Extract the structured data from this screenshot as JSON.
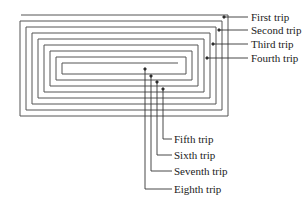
{
  "diagram": {
    "type": "rectangular-spiral",
    "colors": {
      "line": "#555555",
      "text": "#222222",
      "background": "#ffffff"
    },
    "trip_labels": [
      {
        "label": "First trip",
        "side": "right"
      },
      {
        "label": "Second trip",
        "side": "right"
      },
      {
        "label": "Third trip",
        "side": "right"
      },
      {
        "label": "Fourth trip",
        "side": "right"
      },
      {
        "label": "Fifth trip",
        "side": "bottom"
      },
      {
        "label": "Sixth trip",
        "side": "bottom"
      },
      {
        "label": "Seventh trip",
        "side": "bottom"
      },
      {
        "label": "Eighth trip",
        "side": "bottom"
      }
    ]
  }
}
